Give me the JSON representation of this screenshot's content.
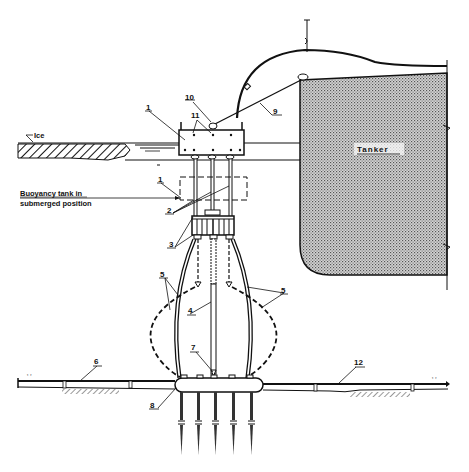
{
  "diagram": {
    "colors": {
      "line": "#111111",
      "tanker_fill": "#bdbdbd",
      "background": "#ffffff"
    },
    "labels": {
      "ice": "Ice",
      "tanker": "Tanker",
      "buoyancy_line1": "Buoyancy tank in",
      "buoyancy_line2": "submerged position",
      "n1_top": "1",
      "n1_sub": "1",
      "n2": "2",
      "n3": "3",
      "n4": "4",
      "n5_left": "5",
      "n5_right": "5",
      "n6": "6",
      "n7": "7",
      "n8": "8",
      "n9": "9",
      "n10": "10",
      "n11": "11",
      "n12": "12"
    },
    "callouts": [
      {
        "id": "1",
        "meaning": "buoyancy tank (surface and submerged position)"
      },
      {
        "id": "2",
        "meaning": "guide columns"
      },
      {
        "id": "3",
        "meaning": "swivel / collar assembly"
      },
      {
        "id": "4",
        "meaning": "central riser"
      },
      {
        "id": "5",
        "meaning": "flexible hoses (shown in two positions)"
      },
      {
        "id": "6",
        "meaning": "pipeline (left)"
      },
      {
        "id": "7",
        "meaning": "riser base connection"
      },
      {
        "id": "8",
        "meaning": "pipeline end manifold / base"
      },
      {
        "id": "9",
        "meaning": "mooring line to tanker"
      },
      {
        "id": "10",
        "meaning": "mooring attachment"
      },
      {
        "id": "11",
        "meaning": "connection points on tank"
      },
      {
        "id": "12",
        "meaning": "pipeline (right)"
      }
    ]
  }
}
